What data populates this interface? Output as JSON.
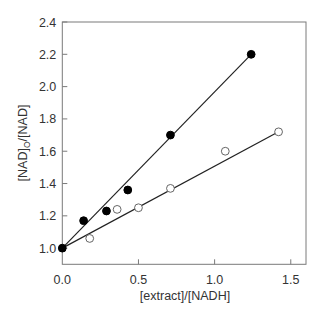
{
  "chart_data": {
    "type": "scatter",
    "title": "",
    "xlabel": "[extract]/[NADH]",
    "ylabel": "[NAD]o/[NAD]",
    "ylabel_parts": {
      "pre": "[NAD]",
      "sub": "O",
      "post": "/[NAD]"
    },
    "xlim": [
      0,
      1.6
    ],
    "ylim": [
      0.9,
      2.4
    ],
    "xticks": [
      0.0,
      0.5,
      1.0,
      1.5
    ],
    "xtick_labels": [
      "0.0",
      "0.5",
      "1.0",
      "1.5"
    ],
    "yticks": [
      1.0,
      1.2,
      1.4,
      1.6,
      1.8,
      2.0,
      2.2,
      2.4
    ],
    "ytick_labels": [
      "1.0",
      "1.2",
      "1.4",
      "1.6",
      "1.8",
      "2.0",
      "2.2",
      "2.4"
    ],
    "grid": false,
    "legend": null,
    "series": [
      {
        "name": "filled circles",
        "marker": "filled-circle",
        "color": "#000000",
        "x": [
          0.0,
          0.14,
          0.29,
          0.43,
          0.71,
          1.24
        ],
        "y": [
          1.0,
          1.17,
          1.23,
          1.36,
          1.7,
          2.2
        ],
        "fit_line": {
          "x": [
            0.0,
            1.24
          ],
          "y": [
            1.0,
            2.2
          ]
        }
      },
      {
        "name": "open circles",
        "marker": "open-circle",
        "color": "#000000",
        "x": [
          0.18,
          0.36,
          0.5,
          0.71,
          1.07,
          1.42
        ],
        "y": [
          1.06,
          1.24,
          1.25,
          1.37,
          1.6,
          1.72
        ],
        "fit_line": {
          "x": [
            0.0,
            1.42
          ],
          "y": [
            1.0,
            1.72
          ]
        }
      }
    ]
  }
}
